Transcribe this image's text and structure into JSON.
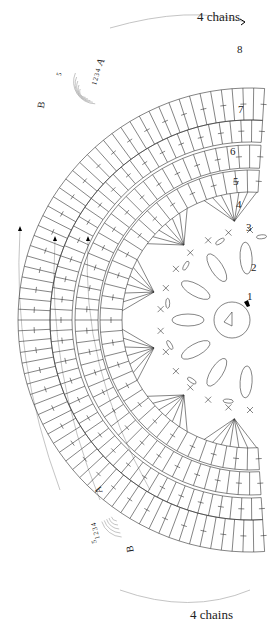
{
  "diagram": {
    "type": "crochet-chart",
    "top_label": "4 chains",
    "bottom_label": "4 chains",
    "row_labels": [
      "1",
      "2",
      "3",
      "4",
      "5",
      "6",
      "7",
      "8"
    ],
    "top_marker_a": "A",
    "top_marker_b": "B",
    "bottom_marker_a": "A",
    "bottom_marker_b": "B",
    "top_small_numbers": [
      "1",
      "2",
      "3",
      "4",
      "5"
    ],
    "bottom_small_numbers": [
      "1",
      "2",
      "3",
      "4",
      "5"
    ],
    "stroke_color": "#333333",
    "guide_color": "#aaaaaa",
    "start_marker_color": "#000000"
  }
}
